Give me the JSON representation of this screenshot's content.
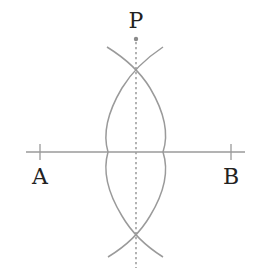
{
  "diagram": {
    "labels": {
      "point_p": "P",
      "point_a": "A",
      "point_b": "B"
    },
    "colors": {
      "line": "#9a9a9a",
      "arc": "#9a9a9a",
      "dotted": "#a0a0a0",
      "text": "#222222",
      "background": "#ffffff"
    },
    "elements": [
      {
        "type": "segment",
        "name": "line-AB",
        "from": [
          26,
          152
        ],
        "to": [
          245,
          152
        ]
      },
      {
        "type": "tick",
        "name": "tick-A",
        "at": [
          40,
          152
        ]
      },
      {
        "type": "tick",
        "name": "tick-B",
        "at": [
          231,
          152
        ]
      },
      {
        "type": "point",
        "name": "point-P",
        "at": [
          136,
          39
        ]
      },
      {
        "type": "dotted-line",
        "name": "perpendicular-bisector",
        "from": [
          136,
          39
        ],
        "to": [
          136,
          268
        ]
      },
      {
        "type": "arc",
        "name": "arc-left",
        "from": [
          163,
          47
        ],
        "through": [
          108,
          152
        ],
        "to": [
          163,
          257
        ]
      },
      {
        "type": "arc",
        "name": "arc-right",
        "from": [
          107,
          47
        ],
        "through": [
          163,
          152
        ],
        "to": [
          108,
          257
        ]
      },
      {
        "type": "intersection",
        "name": "upper-intersection",
        "at": [
          136,
          68
        ]
      },
      {
        "type": "intersection",
        "name": "lower-intersection",
        "at": [
          136,
          231
        ]
      }
    ]
  }
}
